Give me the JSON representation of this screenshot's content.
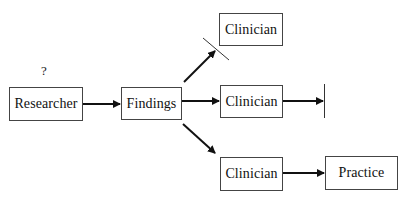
{
  "diagram": {
    "nodes": {
      "researcher": {
        "label": "Researcher"
      },
      "findings": {
        "label": "Findings"
      },
      "clinician_top": {
        "label": "Clinician"
      },
      "clinician_middle": {
        "label": "Clinician"
      },
      "clinician_bottom": {
        "label": "Clinician"
      },
      "practice": {
        "label": "Practice"
      }
    },
    "annotations": {
      "researcher_question": "?"
    },
    "edges": [
      {
        "from": "researcher",
        "to": "findings",
        "blocked": false
      },
      {
        "from": "findings",
        "to": "clinician_top",
        "blocked": true
      },
      {
        "from": "findings",
        "to": "clinician_middle",
        "blocked": false
      },
      {
        "from": "clinician_middle",
        "to": "end",
        "blocked": true
      },
      {
        "from": "findings",
        "to": "clinician_bottom",
        "blocked": false
      },
      {
        "from": "clinician_bottom",
        "to": "practice",
        "blocked": false
      }
    ],
    "colors": {
      "stroke": "#111111",
      "box_border": "#444444"
    }
  }
}
